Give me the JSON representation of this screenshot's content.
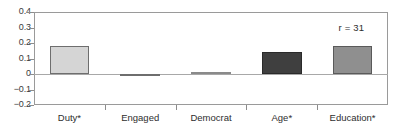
{
  "chart_data": {
    "type": "bar",
    "title": "",
    "subtitle": "",
    "xlabel": "",
    "ylabel": "",
    "categories": [
      "Duty*",
      "Engaged",
      "Democrat",
      "Age*",
      "Education*"
    ],
    "values": [
      0.18,
      -0.01,
      0.012,
      0.14,
      0.18
    ],
    "series": [
      {
        "name": "coefficient",
        "values": [
          0.18,
          -0.01,
          0.012,
          0.14,
          0.18
        ]
      }
    ],
    "bar_colors": [
      "#d5d5d5",
      "#c9c9c9",
      "#ececec",
      "#3f3f3f",
      "#8f8f8f"
    ],
    "bar_edge_colors": [
      "#6e6e6e",
      "#6e6e6e",
      "#8a8a8a",
      "#2a2a2a",
      "#5a5a5a"
    ],
    "ylim": [
      -0.2,
      0.4
    ],
    "ytick_values": [
      0.4,
      0.3,
      0.2,
      0.1,
      0,
      -0.1,
      -0.2
    ],
    "ytick_labels": [
      "0.4",
      "0.3",
      "0.2",
      "0.1",
      "0",
      "−0.1",
      "−0.2"
    ],
    "grid": false,
    "legend": false,
    "legend_position": "none",
    "annotations": [
      {
        "text": "r = 31",
        "x": 0.86,
        "y": 0.3
      }
    ],
    "zero_line": 0,
    "frame": true
  }
}
